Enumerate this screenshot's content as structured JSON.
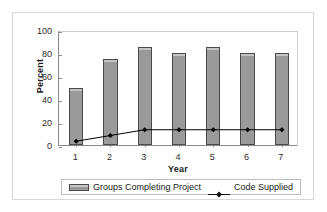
{
  "chart_data": {
    "type": "bar",
    "title": "",
    "xlabel": "Year",
    "ylabel": "Percent",
    "categories": [
      "1",
      "2",
      "3",
      "4",
      "5",
      "6",
      "7"
    ],
    "ylim": [
      0,
      100
    ],
    "yticks": [
      "0",
      "20",
      "40",
      "60",
      "80",
      "100"
    ],
    "grid": false,
    "legend_position": "bottom",
    "series": [
      {
        "name": "Groups Completing Project",
        "type": "bar",
        "color": "#9a9a9a",
        "values": [
          50,
          75,
          85,
          80,
          85,
          80,
          80
        ]
      },
      {
        "name": "Code Supplied",
        "type": "line",
        "color": "#000000",
        "marker": "diamond",
        "values": [
          5,
          10,
          15,
          15,
          15,
          15,
          15
        ]
      }
    ]
  },
  "legend": {
    "items": [
      {
        "label": "Groups Completing Project",
        "swatch": "bar-swatch"
      },
      {
        "label": "Code Supplied",
        "swatch": "line-marker-swatch"
      }
    ]
  }
}
